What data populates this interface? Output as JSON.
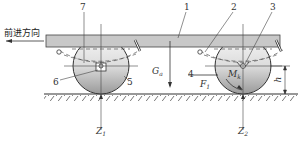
{
  "diagram": {
    "direction_label": "前进方向",
    "part_numbers": [
      "1",
      "2",
      "3",
      "4",
      "5",
      "6",
      "7"
    ],
    "forces": {
      "gravity": {
        "symbol": "G",
        "sub": "a"
      },
      "traction": {
        "symbol": "F",
        "sub": "1"
      },
      "front_normal": {
        "symbol": "Z",
        "sub": "1"
      },
      "rear_normal": {
        "symbol": "Z",
        "sub": "2"
      },
      "moment": {
        "symbol": "M",
        "sub": "k"
      },
      "height": {
        "symbol": "h"
      }
    },
    "colors": {
      "frame_fill": "#c8c8c8",
      "wheel_fill_top": "#f2f2f2",
      "wheel_fill_bottom": "#9a9a9a",
      "line": "#333333",
      "background": "#ffffff"
    }
  }
}
